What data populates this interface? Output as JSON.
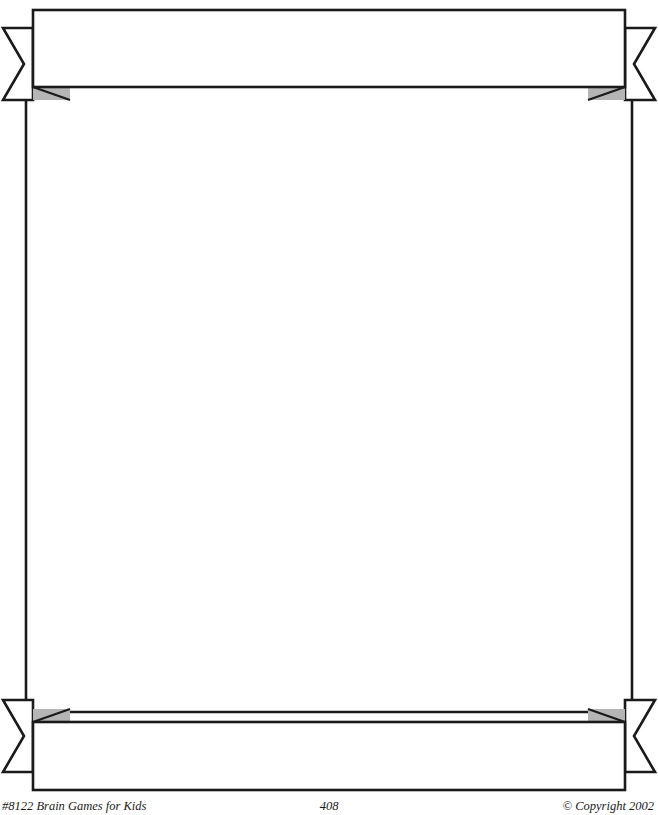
{
  "page": {
    "kind": "worksheet-page-border-template",
    "background_color": "#ffffff",
    "width": 658,
    "height": 815
  },
  "frame": {
    "line_color": "#1a1a1a",
    "line_width": 2.6,
    "fill_color": "#ffffff",
    "shadow_color": "#b5b5b5",
    "shadow_line_color": "#1a1a1a",
    "left_rule_x": 26,
    "right_rule_x": 632,
    "rule_top_y": 100,
    "rule_bottom_y": 712
  },
  "top_banner": {
    "name": "top-ribbon-banner",
    "body_left": 33,
    "body_right": 625,
    "body_top": 10,
    "body_bottom": 87,
    "tail_left_tip_x": 3,
    "tail_right_tip_x": 655,
    "tail_top": 28,
    "tail_bottom": 100,
    "text": ""
  },
  "bottom_banner": {
    "name": "bottom-ribbon-banner",
    "body_left": 33,
    "body_right": 625,
    "body_top": 722,
    "body_bottom": 790,
    "tail_left_tip_x": 3,
    "tail_right_tip_x": 655,
    "tail_top": 700,
    "tail_bottom": 772,
    "text": ""
  },
  "content_area": {
    "name": "writing-area",
    "text": ""
  },
  "footer": {
    "left": "#8122 Brain Games for Kids",
    "center": "408",
    "right": "© Copyright 2002"
  }
}
